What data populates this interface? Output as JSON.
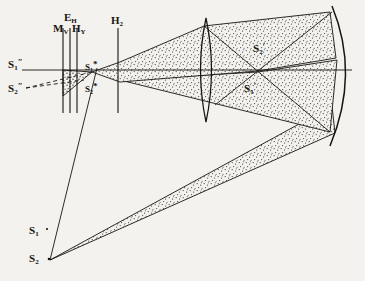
{
  "figure": {
    "kind": "optical-ray-diagram",
    "background_color": "#f3f2ef",
    "ink_color": "#17150f",
    "stipple_color": "#4a4740",
    "width": 365,
    "height": 281
  },
  "labels": {
    "e_h": {
      "base": "E",
      "sub": "H",
      "sup": "",
      "x": 64,
      "y": 8,
      "name": "label-e-h"
    },
    "m_v": {
      "base": "M",
      "sub": "V",
      "sup": "",
      "x": 55,
      "y": 18,
      "name": "label-m-v"
    },
    "h_v": {
      "base": "H",
      "sub": "Y",
      "sup": "",
      "x": 74,
      "y": 18,
      "name": "label-h-v"
    },
    "h_2": {
      "base": "H",
      "sub": "2",
      "sup": "",
      "x": 113,
      "y": 12,
      "name": "label-h-2"
    },
    "s1pp": {
      "base": "S",
      "sub": "1",
      "sup": "″",
      "x": 7,
      "y": 56,
      "name": "label-s1-double-prime"
    },
    "s2pp": {
      "base": "S",
      "sub": "2",
      "sup": "″",
      "x": 7,
      "y": 80,
      "name": "label-s2-double-prime"
    },
    "s1star": {
      "base": "S",
      "sub": "1",
      "sup": "*",
      "x": 84,
      "y": 58,
      "name": "label-s1-star"
    },
    "s2star": {
      "base": "S",
      "sub": "2",
      "sup": "*",
      "x": 84,
      "y": 80,
      "name": "label-s2-star"
    },
    "s2p": {
      "base": "S",
      "sub": "2",
      "sup": "′",
      "x": 252,
      "y": 40,
      "name": "label-s2-prime"
    },
    "s1p": {
      "base": "S",
      "sub": "1",
      "sup": "′",
      "x": 243,
      "y": 80,
      "name": "label-s1-prime"
    },
    "s1": {
      "base": "S",
      "sub": "1",
      "sup": "",
      "x": 28,
      "y": 222,
      "name": "label-s1"
    },
    "s2": {
      "base": "S",
      "sub": "2",
      "sup": "",
      "x": 28,
      "y": 250,
      "name": "label-s2"
    }
  },
  "elements": {
    "optic_axis": {
      "name": "optic-axis-line",
      "y": 70,
      "x1": 22,
      "x2": 352
    },
    "slit_m_v": {
      "name": "slit-plane-m-v",
      "x": 63,
      "y1": 28,
      "y2": 113
    },
    "slit_e_h": {
      "name": "slit-plane-e-h",
      "x": 70,
      "y1": 28,
      "y2": 113
    },
    "slit_h_v": {
      "name": "slit-plane-h-v",
      "x": 77,
      "y1": 28,
      "y2": 113
    },
    "plane_h_2": {
      "name": "aperture-plane-h-2",
      "x": 118,
      "y1": 28,
      "y2": 113
    },
    "lens": {
      "name": "converging-lens",
      "cx": 206,
      "cy": 70,
      "ry": 52,
      "bulge": 11
    },
    "mirror": {
      "name": "concave-mirror-arc",
      "top_x": 332,
      "top_y": 8,
      "mid_x": 356,
      "mid_y": 72,
      "bot_x": 330,
      "bot_y": 144
    },
    "source_s2": {
      "name": "source-point-s2",
      "x": 48,
      "y": 258
    },
    "source_s1": {
      "name": "source-point-s1",
      "x": 48,
      "y": 228
    }
  },
  "beams": {
    "upper_stippled": {
      "name": "beam-upper-cone",
      "description": "cone from S2* through H2 to lens and mirror"
    },
    "lower_stippled": {
      "name": "beam-lower-cone",
      "description": "cone along optic axis to mirror"
    },
    "long_diagonal": {
      "name": "beam-s2-to-mirror",
      "description": "narrow beam from S2 up to mirror"
    },
    "slit_wedge": {
      "name": "beam-slit-wedge",
      "description": "small stippled wedge between slits"
    }
  },
  "rays": {
    "dashed_s2pp": {
      "name": "virtual-ray-s2-double-prime",
      "dash": "4,3"
    },
    "dashed_s1pp": {
      "name": "virtual-ray-s1-double-prime",
      "dash": "4,3"
    }
  }
}
